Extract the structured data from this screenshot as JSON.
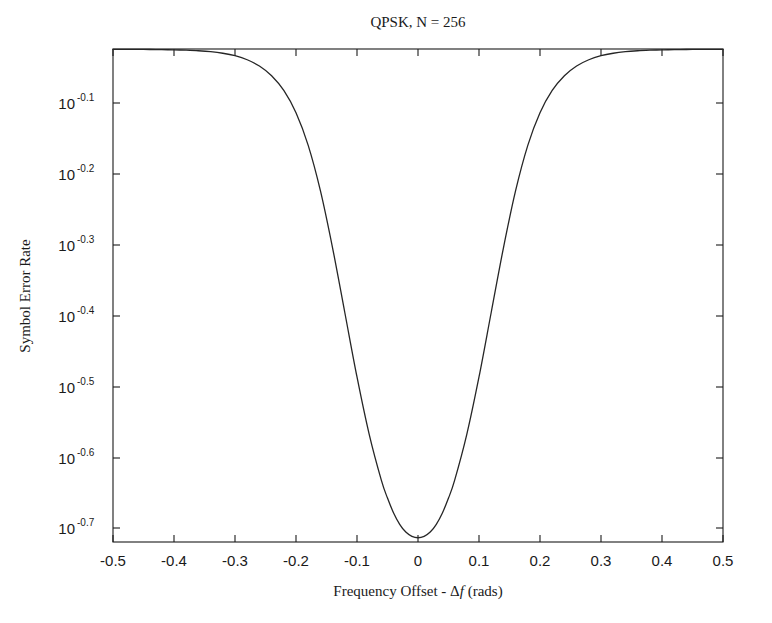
{
  "figure": {
    "title": "QPSK, N = 256",
    "background_color": "#ffffff",
    "line_color": "#262626",
    "axis_color": "#1a1a1a"
  },
  "axes": {
    "x_label_prefix": "Frequency Offset - ",
    "x_label_delta": "Δ",
    "x_label_f": "f",
    "x_label_suffix": " (rads)",
    "x_label_full": "Frequency Offset - Δf (rads)",
    "y_label": "Symbol Error Rate",
    "x_ticks": [
      "-0.5",
      "-0.4",
      "-0.3",
      "-0.2",
      "-0.1",
      "0",
      "0.1",
      "0.2",
      "0.3",
      "0.4",
      "0.5"
    ],
    "y_tick_mantissa": "10",
    "y_ticks_exponent": [
      "-0.1",
      "-0.2",
      "-0.3",
      "-0.4",
      "-0.5",
      "-0.6",
      "-0.7"
    ],
    "y_ticks_label": [
      "10^-0.1",
      "10^-0.2",
      "10^-0.3",
      "10^-0.4",
      "10^-0.5",
      "10^-0.6",
      "10^-0.7"
    ]
  },
  "chart_data": {
    "type": "line",
    "title": "QPSK, N = 256",
    "xlabel": "Frequency Offset - Δf (rads)",
    "ylabel": "Symbol Error Rate",
    "xlim": [
      -0.5,
      0.5
    ],
    "ylim_log10": [
      -0.72,
      -0.024
    ],
    "yscale": "log",
    "grid": false,
    "legend": null,
    "xticks": [
      -0.5,
      -0.4,
      -0.3,
      -0.2,
      -0.1,
      0,
      0.1,
      0.2,
      0.3,
      0.4,
      0.5
    ],
    "yticks_log10": [
      -0.1,
      -0.2,
      -0.3,
      -0.4,
      -0.5,
      -0.6,
      -0.7
    ],
    "series": [
      {
        "name": "QPSK N=256 symbol error rate",
        "x": [
          -0.5,
          -0.48,
          -0.46,
          -0.44,
          -0.42,
          -0.4,
          -0.38,
          -0.36,
          -0.34,
          -0.32,
          -0.3,
          -0.28,
          -0.26,
          -0.24,
          -0.22,
          -0.2,
          -0.18,
          -0.16,
          -0.14,
          -0.12,
          -0.1,
          -0.08,
          -0.06,
          -0.05,
          -0.04,
          -0.03,
          -0.02,
          -0.01,
          0.0,
          0.01,
          0.02,
          0.03,
          0.04,
          0.05,
          0.06,
          0.08,
          0.1,
          0.12,
          0.14,
          0.16,
          0.18,
          0.2,
          0.22,
          0.24,
          0.26,
          0.28,
          0.3,
          0.32,
          0.34,
          0.36,
          0.38,
          0.4,
          0.42,
          0.44,
          0.46,
          0.48,
          0.5
        ],
        "y_log10": [
          -0.0245,
          -0.0245,
          -0.0246,
          -0.0247,
          -0.0249,
          -0.0252,
          -0.0257,
          -0.0265,
          -0.0278,
          -0.03,
          -0.0335,
          -0.0392,
          -0.048,
          -0.0617,
          -0.0825,
          -0.114,
          -0.16,
          -0.224,
          -0.305,
          -0.396,
          -0.487,
          -0.568,
          -0.633,
          -0.658,
          -0.679,
          -0.695,
          -0.706,
          -0.712,
          -0.714,
          -0.712,
          -0.706,
          -0.695,
          -0.679,
          -0.658,
          -0.633,
          -0.568,
          -0.487,
          -0.396,
          -0.305,
          -0.224,
          -0.16,
          -0.114,
          -0.0825,
          -0.0617,
          -0.048,
          -0.0392,
          -0.0335,
          -0.03,
          -0.0278,
          -0.0265,
          -0.0257,
          -0.0252,
          -0.0249,
          -0.0247,
          -0.0246,
          -0.0245,
          -0.0245
        ],
        "y": [
          0.9452,
          0.9452,
          0.945,
          0.9448,
          0.9444,
          0.9437,
          0.9426,
          0.9409,
          0.9381,
          0.9333,
          0.9258,
          0.9138,
          0.8955,
          0.8679,
          0.827,
          0.7691,
          0.6918,
          0.597,
          0.4955,
          0.4018,
          0.3258,
          0.2704,
          0.2328,
          0.2198,
          0.2094,
          0.2018,
          0.1967,
          0.194,
          0.1932,
          0.194,
          0.1967,
          0.2018,
          0.2094,
          0.2198,
          0.2328,
          0.2704,
          0.3258,
          0.4018,
          0.4955,
          0.597,
          0.6918,
          0.7691,
          0.827,
          0.8679,
          0.8955,
          0.9138,
          0.9258,
          0.9333,
          0.9381,
          0.9409,
          0.9426,
          0.9437,
          0.9444,
          0.9448,
          0.945,
          0.9452,
          0.9452
        ],
        "minimum": {
          "x": 0,
          "y_log10": -0.714,
          "y": 0.193
        },
        "saturation_level_log10": -0.0245,
        "shape": "symmetric well / notch centered at zero offset"
      }
    ]
  }
}
